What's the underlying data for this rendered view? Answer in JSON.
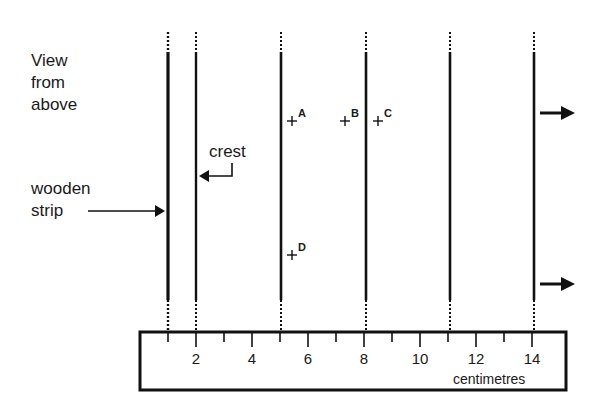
{
  "labels": {
    "view": [
      "View",
      "from",
      "above"
    ],
    "wooden_strip": [
      "wooden",
      "strip"
    ],
    "crest": "crest",
    "units": "centimetres"
  },
  "points": [
    {
      "name": "A",
      "x_cm": 5.4,
      "y": 120
    },
    {
      "name": "B",
      "x_cm": 7.3,
      "y": 120
    },
    {
      "name": "C",
      "x_cm": 8.5,
      "y": 120
    },
    {
      "name": "D",
      "x_cm": 5.4,
      "y": 254
    }
  ],
  "crest_lines_cm": [
    1,
    2,
    5,
    8,
    11,
    14
  ],
  "ruler": {
    "tick_labels": [
      "2",
      "4",
      "6",
      "8",
      "10",
      "12",
      "14"
    ],
    "range_cm": [
      0,
      15
    ]
  },
  "arrows": [
    "wave-direction-top",
    "wave-direction-bottom"
  ]
}
